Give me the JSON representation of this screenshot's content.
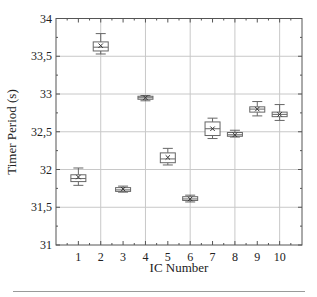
{
  "chart_data": {
    "type": "box",
    "title": "",
    "xlabel": "IC Number",
    "ylabel": "Timer Period  (s)",
    "xlim": [
      0,
      11
    ],
    "ylim": [
      31,
      34
    ],
    "yticks": [
      "31",
      "31,5",
      "32",
      "32,5",
      "33",
      "33,5",
      "34"
    ],
    "ytick_values": [
      31,
      31.5,
      32,
      32.5,
      33,
      33.5,
      34
    ],
    "xticks": [
      "1",
      "2",
      "3",
      "4",
      "5",
      "6",
      "7",
      "8",
      "9",
      "10"
    ],
    "grid": {
      "horizontal": [
        31.5,
        32,
        32.5,
        33,
        33.5
      ],
      "vertical": [
        2,
        4,
        6,
        8,
        10
      ]
    },
    "categories": [
      "1",
      "2",
      "3",
      "4",
      "5",
      "6",
      "7",
      "8",
      "9",
      "10"
    ],
    "boxes": [
      {
        "ic": 1,
        "whisker_low": 31.79,
        "q1": 31.84,
        "median": 31.88,
        "mean": 31.9,
        "q3": 31.93,
        "whisker_high": 32.02
      },
      {
        "ic": 2,
        "whisker_low": 33.53,
        "q1": 33.57,
        "median": 33.62,
        "mean": 33.64,
        "q3": 33.69,
        "whisker_high": 33.8
      },
      {
        "ic": 3,
        "whisker_low": 31.7,
        "q1": 31.71,
        "median": 31.73,
        "mean": 31.74,
        "q3": 31.76,
        "whisker_high": 31.78
      },
      {
        "ic": 4,
        "whisker_low": 32.91,
        "q1": 32.93,
        "median": 32.95,
        "mean": 32.95,
        "q3": 32.97,
        "whisker_high": 32.98
      },
      {
        "ic": 5,
        "whisker_low": 32.06,
        "q1": 32.09,
        "median": 32.14,
        "mean": 32.16,
        "q3": 32.22,
        "whisker_high": 32.28
      },
      {
        "ic": 6,
        "whisker_low": 31.57,
        "q1": 31.59,
        "median": 31.61,
        "mean": 31.61,
        "q3": 31.64,
        "whisker_high": 31.66
      },
      {
        "ic": 7,
        "whisker_low": 32.41,
        "q1": 32.45,
        "median": 32.54,
        "mean": 32.54,
        "q3": 32.63,
        "whisker_high": 32.68
      },
      {
        "ic": 8,
        "whisker_low": 32.43,
        "q1": 32.44,
        "median": 32.46,
        "mean": 32.46,
        "q3": 32.49,
        "whisker_high": 32.52
      },
      {
        "ic": 9,
        "whisker_low": 32.71,
        "q1": 32.76,
        "median": 32.8,
        "mean": 32.8,
        "q3": 32.83,
        "whisker_high": 32.9
      },
      {
        "ic": 10,
        "whisker_low": 32.65,
        "q1": 32.7,
        "median": 32.73,
        "mean": 32.73,
        "q3": 32.76,
        "whisker_high": 32.86
      }
    ],
    "legend": null
  },
  "style": {
    "axis_color": "#555555",
    "grid_color": "#c8c8c8",
    "box_color": "#666666",
    "rule_color": "#9a9a9a"
  }
}
